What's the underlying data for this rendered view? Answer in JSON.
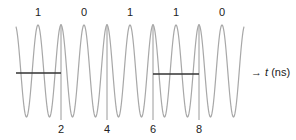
{
  "diagram": {
    "type": "carrier-waveform",
    "bits": [
      {
        "label": "1",
        "x": 38
      },
      {
        "label": "0",
        "x": 84
      },
      {
        "label": "1",
        "x": 130
      },
      {
        "label": "1",
        "x": 176
      },
      {
        "label": "0",
        "x": 222
      }
    ],
    "time_ticks": [
      {
        "label": "2",
        "x": 61
      },
      {
        "label": "4",
        "x": 107
      },
      {
        "label": "6",
        "x": 153
      },
      {
        "label": "8",
        "x": 199
      }
    ],
    "axis": {
      "arrow": "→",
      "variable": "t",
      "unit": "(ns)"
    },
    "wave": {
      "x_start": 16,
      "x_end": 244,
      "first_peak_x": 38,
      "period_px": 23,
      "y_center": 71,
      "amplitude": 46,
      "color": "#a8a8a8"
    },
    "reference_bars": [
      {
        "x1": 16,
        "x2": 61,
        "y": 73
      },
      {
        "x1": 153,
        "x2": 199,
        "y": 74
      }
    ],
    "marker_lines": [
      {
        "x": 61,
        "y1": 24,
        "y2": 120
      },
      {
        "x": 107,
        "y1": 24,
        "y2": 120
      },
      {
        "x": 153,
        "y1": 24,
        "y2": 120
      },
      {
        "x": 199,
        "y1": 24,
        "y2": 120
      }
    ],
    "colors": {
      "wave": "#a8a8a8",
      "bar": "#333333",
      "marker": "#9a9a9a",
      "text": "#222222"
    }
  }
}
